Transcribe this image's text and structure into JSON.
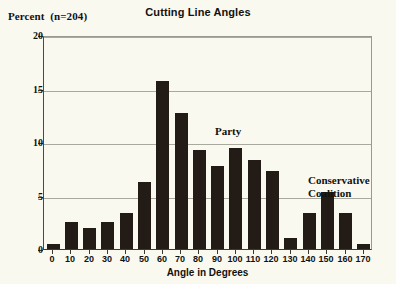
{
  "chart": {
    "title": "Cutting Line Angles",
    "yaxis_title": "Percent  (n=204)",
    "xaxis_title": "Angle in Degrees"
  },
  "annotations": {
    "party": "Party",
    "conservative_coalition": "Conservative\nCoalition"
  },
  "colors": {
    "bar": "#231c16",
    "background": "#faf9f0",
    "gridline": "#a9a99e",
    "axis": "#3a3a33",
    "text": "#111111"
  },
  "chart_data": {
    "type": "bar",
    "title": "Cutting Line Angles",
    "subtitle": "",
    "xlabel": "Angle in Degrees",
    "ylabel": "Percent  (n=204)",
    "xlim": [
      -5,
      175
    ],
    "ylim": [
      0,
      20
    ],
    "yticks": [
      0,
      5,
      10,
      15,
      20
    ],
    "ytick_labels": [
      "0",
      "5",
      "10",
      "15",
      "20"
    ],
    "grid": true,
    "legend": "none",
    "n": 204,
    "categories": [
      0,
      10,
      20,
      30,
      40,
      50,
      60,
      70,
      80,
      90,
      100,
      110,
      120,
      130,
      140,
      150,
      160,
      170
    ],
    "xtick_labels": [
      "0",
      "10",
      "20",
      "30",
      "40",
      "50",
      "60",
      "70",
      "80",
      "90",
      "100",
      "110",
      "120",
      "130",
      "140",
      "150",
      "160",
      "170"
    ],
    "values": [
      0.5,
      2.5,
      2.0,
      2.5,
      3.4,
      6.3,
      15.7,
      12.7,
      9.3,
      7.8,
      9.4,
      8.3,
      7.3,
      1.0,
      3.4,
      5.3,
      3.4,
      0.5
    ],
    "annotations": [
      {
        "text": "Party",
        "x": 70,
        "y": 14.0
      },
      {
        "text": "Conservative Coalition",
        "x": 125,
        "y": 9.6
      }
    ]
  }
}
